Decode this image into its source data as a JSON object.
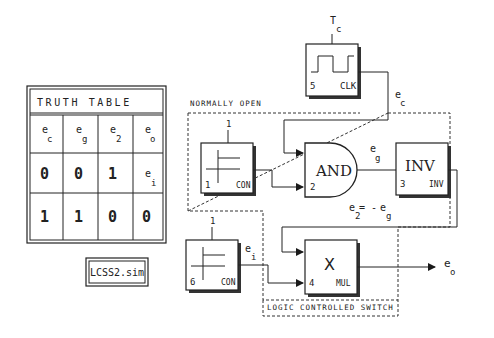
{
  "truth_table": {
    "title": "TRUTH TABLE",
    "headers": [
      {
        "base": "e",
        "sub": "c"
      },
      {
        "base": "e",
        "sub": "g"
      },
      {
        "base": "e",
        "sub": "2"
      },
      {
        "base": "e",
        "sub": "o"
      }
    ],
    "rows": [
      [
        {
          "v": "0"
        },
        {
          "v": "0"
        },
        {
          "v": "1"
        },
        {
          "base": "e",
          "sub": "i"
        }
      ],
      [
        {
          "v": "1"
        },
        {
          "v": "1"
        },
        {
          "v": "0"
        },
        {
          "v": "0"
        }
      ]
    ]
  },
  "file_label": "LCSS2.sim",
  "regions": {
    "normally_open": "NORMALLY OPEN",
    "logic_switch": "LOGIC CONTROLLED SWITCH"
  },
  "blocks": {
    "clk": {
      "number": "5",
      "type": "CLK",
      "param_base": "T",
      "param_sub": "c"
    },
    "con1": {
      "number": "1",
      "type": "CON",
      "param": "1"
    },
    "and": {
      "number": "2",
      "label": "AND"
    },
    "inv": {
      "number": "3",
      "type": "INV",
      "label": "INV"
    },
    "con6": {
      "number": "6",
      "type": "CON",
      "param": "1"
    },
    "mul": {
      "number": "4",
      "type": "MUL",
      "label": "X"
    }
  },
  "signals": {
    "ec": {
      "base": "e",
      "sub": "c"
    },
    "eg": {
      "base": "e",
      "sub": "g"
    },
    "e2_eq": {
      "base": "e",
      "sub": "2",
      "eq": "= - ",
      "base2": "e",
      "sub2": "g"
    },
    "ei": {
      "base": "e",
      "sub": "i"
    },
    "eo": {
      "base": "e",
      "sub": "o"
    }
  }
}
